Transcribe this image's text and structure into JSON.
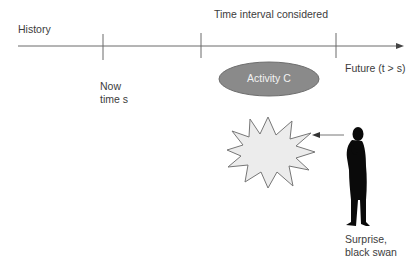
{
  "timeline": {
    "history_label": "History",
    "interval_label": "Time interval considered",
    "now_label_line1": "Now",
    "now_label_line2": "time s",
    "future_label": "Future (t > s)"
  },
  "activity": {
    "label": "Activity C",
    "fill": "#8a8a8a"
  },
  "event": {
    "icon": "starburst-icon",
    "fill": "#ececec"
  },
  "observer": {
    "icon": "person-silhouette-icon",
    "label_line1": "Surprise,",
    "label_line2": "black swan"
  },
  "colors": {
    "line": "#6a6a6a",
    "text": "#3c3c3c"
  }
}
